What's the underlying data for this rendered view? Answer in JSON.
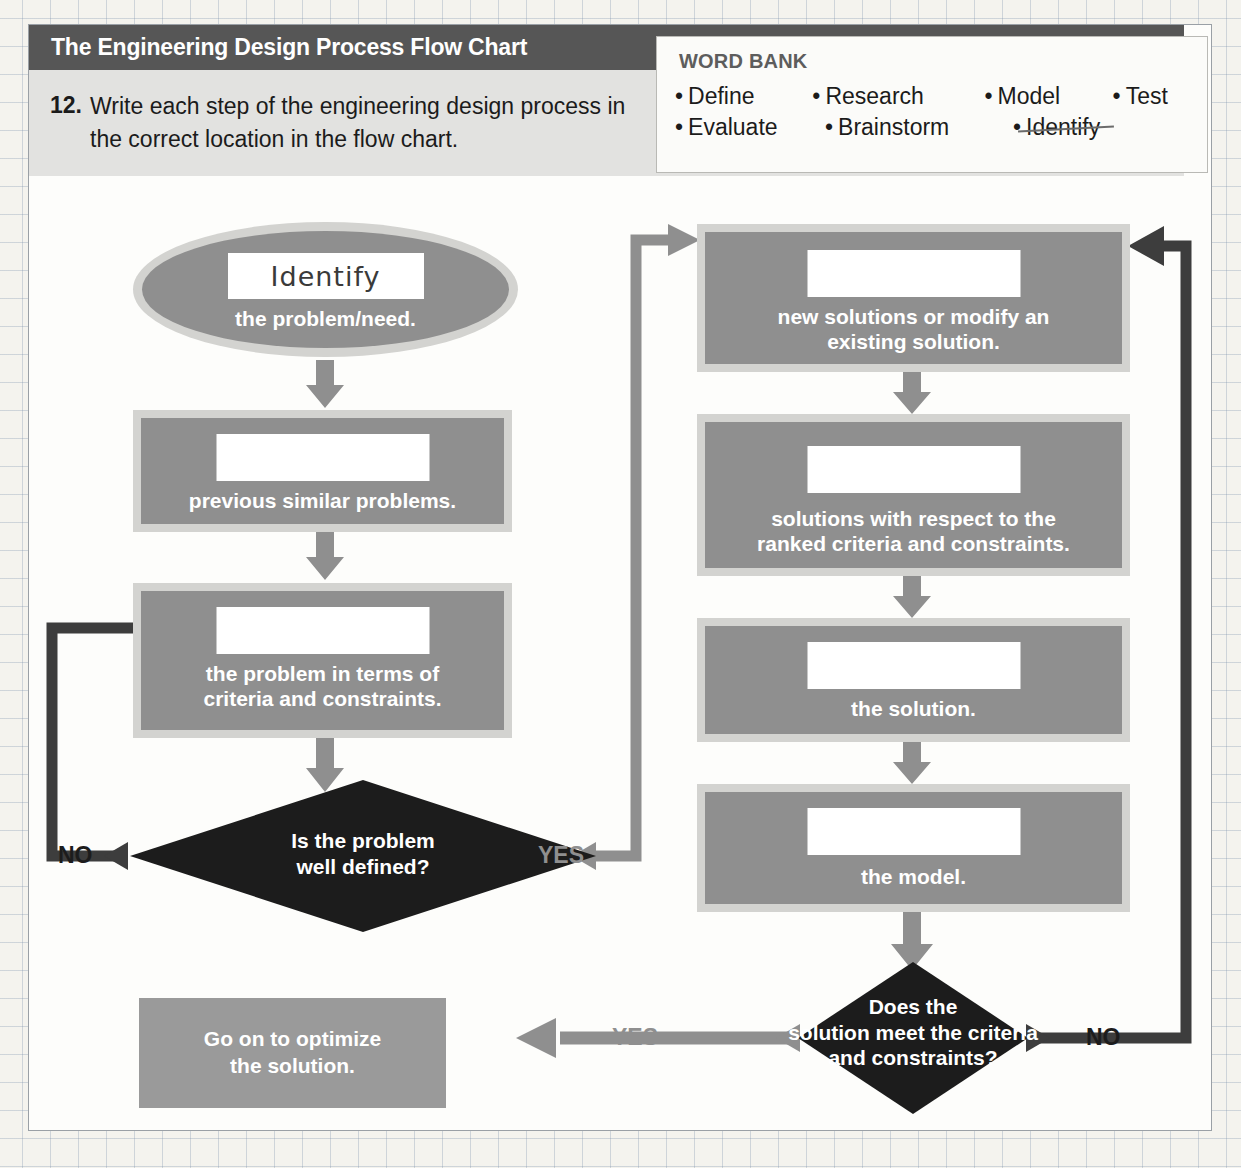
{
  "header": {
    "title": "The Engineering Design Process Flow Chart",
    "question_number": "12.",
    "question_text": "Write each step of the engineering design process in the correct location in the flow chart."
  },
  "word_bank": {
    "title": "WORD BANK",
    "rows": [
      [
        {
          "label": "Define",
          "used": false
        },
        {
          "label": "Research",
          "used": false
        },
        {
          "label": "Model",
          "used": false
        },
        {
          "label": "Test",
          "used": false
        }
      ],
      [
        {
          "label": "Evaluate",
          "used": false
        },
        {
          "label": "Brainstorm",
          "used": false
        },
        {
          "label": "Identify",
          "used": true
        }
      ]
    ],
    "bullet": "•"
  },
  "flow": {
    "start": {
      "answer": "Identify",
      "caption": "the problem/need."
    },
    "left_steps": [
      {
        "answer": "",
        "caption": "previous similar problems."
      },
      {
        "answer": "",
        "caption": "the problem in terms of\ncriteria and constraints."
      }
    ],
    "decision_1": {
      "caption": "Is the problem\nwell defined?",
      "no_label": "NO",
      "yes_label": "YES"
    },
    "right_steps": [
      {
        "answer": "",
        "caption": "new solutions or modify an\nexisting solution."
      },
      {
        "answer": "",
        "caption": "solutions with respect to the\nranked criteria and constraints."
      },
      {
        "answer": "",
        "caption": "the solution."
      },
      {
        "answer": "",
        "caption": "the model."
      }
    ],
    "decision_2": {
      "caption": "Does the\nsolution meet the criteria\nand constraints?",
      "yes_label": "YES",
      "no_label": "NO"
    },
    "end": {
      "caption": "Go on to optimize\nthe solution."
    }
  },
  "colors": {
    "header_bar": "#565656",
    "prompt_band": "#e2e2e0",
    "box_fill": "#8f8f8f",
    "box_frame": "#d3d3d0",
    "diamond_fill": "#1c1c1c",
    "arrow_gray": "#8f8f8f",
    "arrow_dark": "#3d3d3d",
    "blank_fill": "#ffffff"
  }
}
